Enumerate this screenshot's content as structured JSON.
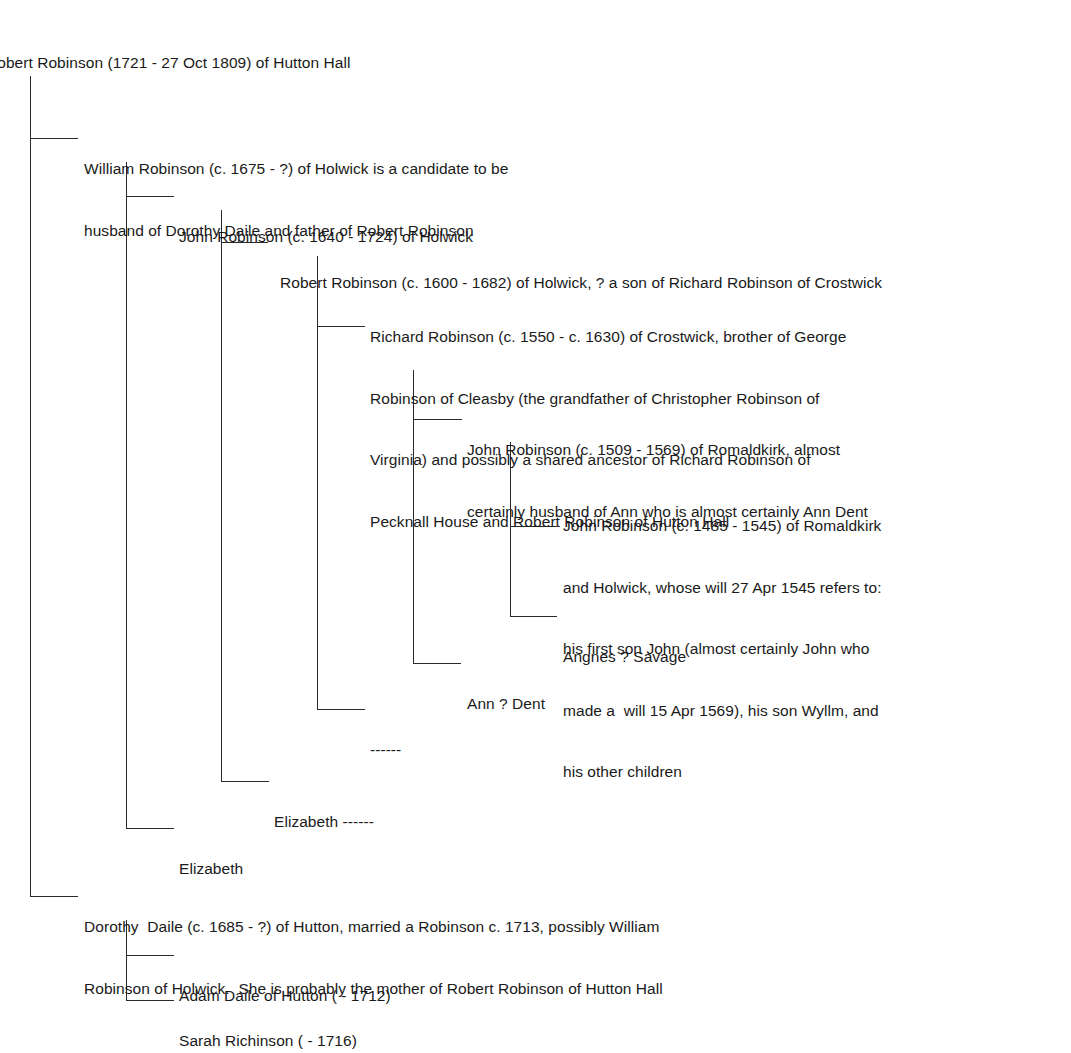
{
  "tree": {
    "root": {
      "label": "Robert Robinson (1721 - 27 Oct 1809) of Hutton Hall"
    },
    "nodes": [
      {
        "id": "william",
        "lines": [
          "William Robinson (c. 1675 - ?) of Holwick is a candidate to be",
          "husband of Dorothy Daile and father of Robert Robinson"
        ]
      },
      {
        "id": "john_1640",
        "lines": [
          "John Robinson (c. 1640 - 1724) of Holwick"
        ]
      },
      {
        "id": "robert_1600",
        "lines": [
          "Robert Robinson (c. 1600 - 1682) of Holwick, ? a son of Richard Robinson of Crostwick"
        ]
      },
      {
        "id": "richard_1550",
        "lines": [
          "Richard Robinson (c. 1550 - c. 1630) of Crostwick, brother of George",
          "Robinson of Cleasby (the grandfather of Christopher Robinson of",
          "Virginia) and possibly a shared ancestor of Richard Robinson of",
          "Pecknall House and Robert Robinson of Hutton Hall"
        ]
      },
      {
        "id": "john_1509",
        "lines": [
          "John Robinson (c. 1509 - 1569) of Romaldkirk, almost",
          "certainly husband of Ann who is almost certainly Ann Dent"
        ]
      },
      {
        "id": "john_1485",
        "lines": [
          "John Robinson (c. 1485 - 1545) of Romaldkirk",
          "and Holwick, whose will 27 Apr 1545 refers to:",
          "his first son John (almost certainly John who",
          "made a  will 15 Apr 1569), his son Wyllm, and",
          "his other children"
        ]
      },
      {
        "id": "angnes",
        "lines": [
          "Angnes ? Savage"
        ]
      },
      {
        "id": "ann_dent",
        "lines": [
          "Ann ? Dent"
        ]
      },
      {
        "id": "unknown_wife",
        "lines": [
          "------"
        ]
      },
      {
        "id": "elizabeth_2",
        "lines": [
          "Elizabeth ------"
        ]
      },
      {
        "id": "elizabeth_1",
        "lines": [
          "Elizabeth"
        ]
      },
      {
        "id": "dorothy",
        "lines": [
          "Dorothy  Daile (c. 1685 - ?) of Hutton, married a Robinson c. 1713, possibly William",
          "Robinson of Holwick.  She is probably the mother of Robert Robinson of Hutton Hall"
        ]
      },
      {
        "id": "adam",
        "lines": [
          "Adam Daile of Hutton ( - 1712)"
        ]
      },
      {
        "id": "sarah",
        "lines": [
          "Sarah Richinson ( - 1716)"
        ]
      }
    ]
  }
}
